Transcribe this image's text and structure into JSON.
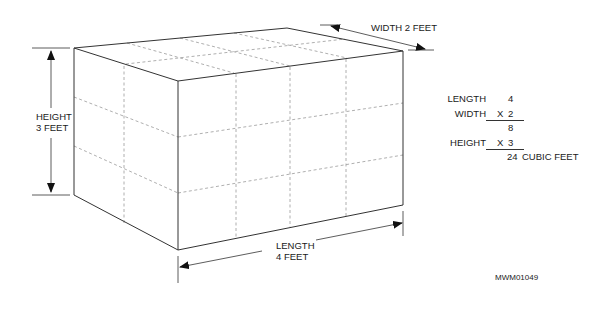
{
  "diagram": {
    "colors": {
      "line": "#333333",
      "dashed": "#9a9a9a",
      "background": "#ffffff"
    },
    "box": {
      "grid": {
        "length_units": 4,
        "width_units": 2,
        "height_units": 3
      }
    },
    "dimensions": {
      "height": {
        "line1": "HEIGHT",
        "line2": "3 FEET"
      },
      "width": {
        "text": "WIDTH 2 FEET"
      },
      "length": {
        "line1": "LENGTH",
        "line2": "4 FEET"
      }
    },
    "calculation": {
      "rows": [
        {
          "label": "LENGTH",
          "op": "",
          "value": "4"
        },
        {
          "label": "WIDTH",
          "op": "X",
          "value": "2"
        },
        {
          "label": "",
          "op": "",
          "value": "8"
        },
        {
          "label": "HEIGHT",
          "op": "X",
          "value": "3"
        },
        {
          "label": "",
          "op": "",
          "value": "24",
          "unit": "CUBIC FEET"
        }
      ]
    },
    "figure_id": "MWM01049"
  }
}
